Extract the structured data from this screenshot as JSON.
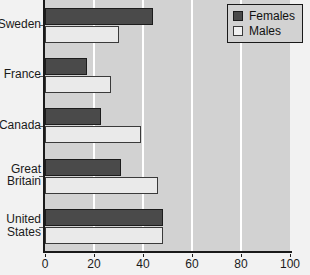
{
  "chart_data": {
    "type": "bar",
    "orientation": "horizontal",
    "title": "",
    "xlabel": "",
    "ylabel": "",
    "categories": [
      "Sweden",
      "France",
      "Canada",
      "Great\nBritain",
      "United\nStates"
    ],
    "series": [
      {
        "name": "Females",
        "color": "#4a4a4a",
        "values": [
          44,
          17,
          23,
          31,
          48
        ]
      },
      {
        "name": "Males",
        "color": "#eaeaea",
        "values": [
          30,
          27,
          39,
          46,
          48
        ]
      }
    ],
    "xlim": [
      0,
      100
    ],
    "xticks": [
      0,
      20,
      40,
      60,
      80,
      100
    ],
    "xtick_labels": [
      "0",
      "20",
      "40",
      "60",
      "80",
      "100"
    ],
    "grid": true,
    "gridlines_at": [
      20,
      40,
      60,
      80
    ],
    "legend_position": "top-right"
  },
  "legend": {
    "entries": [
      {
        "label": "Females",
        "swatch": "females"
      },
      {
        "label": "Males",
        "swatch": "males"
      }
    ]
  },
  "colors": {
    "plot_background": "#d2d2d2",
    "page_background": "#f2f2f2",
    "gridline": "#ffffff",
    "axis": "#1a1a1a",
    "females_fill": "#4a4a4a",
    "males_fill": "#eaeaea",
    "text": "#1a1a1a"
  }
}
